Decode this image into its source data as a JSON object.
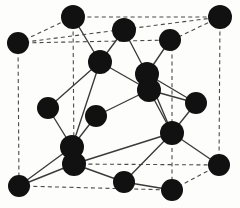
{
  "figure": {
    "background_color": "#fdfdfc",
    "atom_color": "#111111",
    "bond_color": "#3a3a3a",
    "cell_edge_color": "#4b4b4b",
    "atom_radius": 11,
    "atom_count": 18,
    "bond_count": 24,
    "cell_edge_count": 12,
    "width": 240,
    "height": 208
  },
  "atoms": [
    {
      "id": "corner-back-top-left",
      "label": "",
      "cx": 18,
      "cy": 43,
      "r": 11
    },
    {
      "id": "corner-top-back-left",
      "label": "",
      "cx": 73,
      "cy": 17,
      "r": 12
    },
    {
      "id": "corner-top-back-right",
      "label": "",
      "cx": 220,
      "cy": 17,
      "r": 12
    },
    {
      "id": "face-top-center",
      "label": "",
      "cx": 124,
      "cy": 30,
      "r": 12
    },
    {
      "id": "face-top-right",
      "label": "",
      "cx": 170,
      "cy": 40,
      "r": 11
    },
    {
      "id": "interior-upper-left",
      "label": "",
      "cx": 100,
      "cy": 62,
      "r": 12
    },
    {
      "id": "interior-upper-right-a",
      "label": "",
      "cx": 147,
      "cy": 74,
      "r": 12
    },
    {
      "id": "interior-upper-right-b",
      "label": "",
      "cx": 149,
      "cy": 90,
      "r": 12
    },
    {
      "id": "face-left-middle",
      "label": "",
      "cx": 48,
      "cy": 108,
      "r": 11
    },
    {
      "id": "interior-center-left",
      "label": "",
      "cx": 96,
      "cy": 116,
      "r": 11
    },
    {
      "id": "face-right-middle",
      "label": "",
      "cx": 196,
      "cy": 103,
      "r": 11
    },
    {
      "id": "interior-lower-left-a",
      "label": "",
      "cx": 72,
      "cy": 147,
      "r": 12
    },
    {
      "id": "interior-lower-left-b",
      "label": "",
      "cx": 74,
      "cy": 164,
      "r": 12
    },
    {
      "id": "interior-lower-right",
      "label": "",
      "cx": 172,
      "cy": 133,
      "r": 12
    },
    {
      "id": "corner-front-bottom-left",
      "label": "",
      "cx": 19,
      "cy": 186,
      "r": 11
    },
    {
      "id": "face-bottom-center",
      "label": "",
      "cx": 124,
      "cy": 182,
      "r": 11
    },
    {
      "id": "corner-bottom-right-back",
      "label": "",
      "cx": 219,
      "cy": 165,
      "r": 11
    },
    {
      "id": "corner-bottom-front-mid",
      "label": "",
      "cx": 172,
      "cy": 190,
      "r": 11
    }
  ],
  "cell_edges": [
    {
      "id": "edge-back-top",
      "x1": 18,
      "y1": 43,
      "x2": 220,
      "y2": 17
    },
    {
      "id": "edge-back-top-left",
      "x1": 18,
      "y1": 43,
      "x2": 73,
      "y2": 17
    },
    {
      "id": "edge-top-back-span",
      "x1": 73,
      "y1": 17,
      "x2": 220,
      "y2": 17
    },
    {
      "id": "edge-left-vertical",
      "x1": 18,
      "y1": 43,
      "x2": 19,
      "y2": 186
    },
    {
      "id": "edge-mid-vertical",
      "x1": 73,
      "y1": 17,
      "x2": 74,
      "y2": 164
    },
    {
      "id": "edge-right-vertical",
      "x1": 220,
      "y1": 17,
      "x2": 219,
      "y2": 165
    },
    {
      "id": "edge-front-vertical",
      "x1": 172,
      "y1": 40,
      "x2": 172,
      "y2": 190
    },
    {
      "id": "edge-front-top-left",
      "x1": 18,
      "y1": 43,
      "x2": 172,
      "y2": 40
    },
    {
      "id": "edge-front-top-right",
      "x1": 172,
      "y1": 40,
      "x2": 220,
      "y2": 17
    },
    {
      "id": "edge-bottom-front",
      "x1": 19,
      "y1": 186,
      "x2": 172,
      "y2": 190
    },
    {
      "id": "edge-bottom-right",
      "x1": 172,
      "y1": 190,
      "x2": 219,
      "y2": 165
    },
    {
      "id": "edge-bottom-back",
      "x1": 74,
      "y1": 164,
      "x2": 219,
      "y2": 165
    }
  ],
  "bonds": [
    {
      "id": "bond-01",
      "x1": 73,
      "y1": 17,
      "x2": 100,
      "y2": 62
    },
    {
      "id": "bond-02",
      "x1": 124,
      "y1": 30,
      "x2": 100,
      "y2": 62
    },
    {
      "id": "bond-03",
      "x1": 124,
      "y1": 30,
      "x2": 147,
      "y2": 74
    },
    {
      "id": "bond-04",
      "x1": 170,
      "y1": 40,
      "x2": 147,
      "y2": 74
    },
    {
      "id": "bond-05",
      "x1": 100,
      "y1": 62,
      "x2": 48,
      "y2": 108
    },
    {
      "id": "bond-06",
      "x1": 100,
      "y1": 62,
      "x2": 149,
      "y2": 90
    },
    {
      "id": "bond-07",
      "x1": 147,
      "y1": 74,
      "x2": 196,
      "y2": 103
    },
    {
      "id": "bond-08",
      "x1": 147,
      "y1": 74,
      "x2": 149,
      "y2": 90
    },
    {
      "id": "bond-09",
      "x1": 149,
      "y1": 90,
      "x2": 172,
      "y2": 133
    },
    {
      "id": "bond-10",
      "x1": 149,
      "y1": 90,
      "x2": 196,
      "y2": 103
    },
    {
      "id": "bond-11",
      "x1": 96,
      "y1": 116,
      "x2": 72,
      "y2": 147
    },
    {
      "id": "bond-12",
      "x1": 96,
      "y1": 116,
      "x2": 149,
      "y2": 90
    },
    {
      "id": "bond-13",
      "x1": 48,
      "y1": 108,
      "x2": 72,
      "y2": 147
    },
    {
      "id": "bond-14",
      "x1": 196,
      "y1": 103,
      "x2": 172,
      "y2": 133
    },
    {
      "id": "bond-15",
      "x1": 172,
      "y1": 133,
      "x2": 124,
      "y2": 182
    },
    {
      "id": "bond-16",
      "x1": 172,
      "y1": 133,
      "x2": 219,
      "y2": 165
    },
    {
      "id": "bond-17",
      "x1": 172,
      "y1": 133,
      "x2": 147,
      "y2": 74
    },
    {
      "id": "bond-18",
      "x1": 72,
      "y1": 147,
      "x2": 74,
      "y2": 164
    },
    {
      "id": "bond-19",
      "x1": 72,
      "y1": 147,
      "x2": 19,
      "y2": 186
    },
    {
      "id": "bond-20",
      "x1": 74,
      "y1": 164,
      "x2": 124,
      "y2": 182
    },
    {
      "id": "bond-21",
      "x1": 72,
      "y1": 147,
      "x2": 100,
      "y2": 62
    },
    {
      "id": "bond-22",
      "x1": 74,
      "y1": 164,
      "x2": 172,
      "y2": 133
    },
    {
      "id": "bond-23",
      "x1": 19,
      "y1": 186,
      "x2": 74,
      "y2": 164
    },
    {
      "id": "bond-24",
      "x1": 124,
      "y1": 182,
      "x2": 172,
      "y2": 190
    }
  ]
}
